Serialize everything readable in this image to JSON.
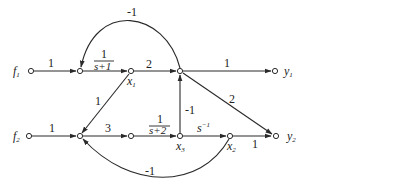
{
  "diagram": {
    "type": "signal-flow-graph",
    "inputs": {
      "f1": {
        "main": "f",
        "sub": "1"
      },
      "f2": {
        "main": "f",
        "sub": "2"
      }
    },
    "outputs": {
      "y1": {
        "main": "y",
        "sub": "1"
      },
      "y2": {
        "main": "y",
        "sub": "2"
      }
    },
    "states": {
      "x1": {
        "main": "x",
        "sub": "1"
      },
      "x2": {
        "main": "x",
        "sub": "2"
      },
      "x3": {
        "main": "x",
        "sub": "3"
      }
    },
    "gains": {
      "f1_to_a": "1",
      "a_to_x1_num": "1",
      "a_to_x1_den": "s+1",
      "x1_to_b": "2",
      "b_to_y1": "1",
      "b_to_y2": "2",
      "feedback_top": "-1",
      "x1_to_c": "1",
      "f2_to_c": "1",
      "c_to_d": "3",
      "d_to_x3_num": "1",
      "d_to_x3_den": "s+2",
      "x3_to_b": "-1",
      "x3_to_x2_base": "s",
      "x3_to_x2_exp": "−1",
      "x2_to_y2": "1",
      "feedback_bottom": "-1"
    }
  }
}
